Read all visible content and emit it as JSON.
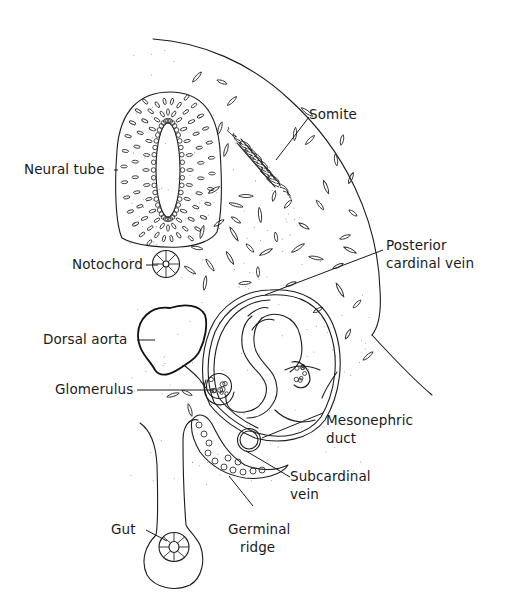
{
  "diagram": {
    "colors": {
      "line": "#1c1c1c",
      "background": "#ffffff",
      "stipple": "#9a9a9a"
    },
    "labels": {
      "neural_tube": "Neural tube",
      "notochord": "Notochord",
      "somite": "Somite",
      "posterior_cardinal_vein_1": "Posterior",
      "posterior_cardinal_vein_2": "cardinal vein",
      "dorsal_aorta": "Dorsal aorta",
      "glomerulus": "Glomerulus",
      "mesonephric_duct_1": "Mesonephric",
      "mesonephric_duct_2": "duct",
      "subcardinal_vein_1": "Subcardinal",
      "subcardinal_vein_2": "vein",
      "gut": "Gut",
      "germinal_ridge_1": "Germinal",
      "germinal_ridge_2": "ridge"
    }
  }
}
